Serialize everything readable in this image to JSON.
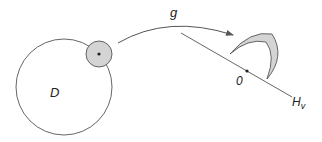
{
  "diagram": {
    "labels": {
      "domain": "D",
      "map": "g",
      "origin": "0",
      "halfplane": "H",
      "halfplane_sub": "v"
    },
    "colors": {
      "stroke": "#555555",
      "fill": "#d4d4d4",
      "background": "#ffffff"
    }
  }
}
